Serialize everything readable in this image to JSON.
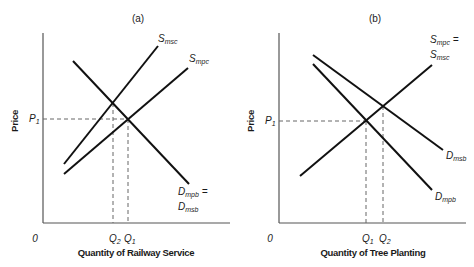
{
  "panels": [
    {
      "title": "(a)",
      "ylabel": "Price",
      "xlabel": "Quantity of Railway Service",
      "origin_label": "0",
      "price_label": {
        "main": "P",
        "sub": "1"
      },
      "quantity_labels": [
        {
          "main": "Q",
          "sub": "2"
        },
        {
          "main": "Q",
          "sub": "1"
        }
      ],
      "curves": [
        {
          "name": "S_msc",
          "label_main": "S",
          "label_sub": "msc"
        },
        {
          "name": "S_mpc",
          "label_main": "S",
          "label_sub": "mpc"
        },
        {
          "name": "D_mpb = D_msb",
          "label_line1_main": "D",
          "label_line1_sub": "mpb",
          "label_line1_suffix": " =",
          "label_line2_main": "D",
          "label_line2_sub": "msb"
        }
      ]
    },
    {
      "title": "(b)",
      "ylabel": "Price",
      "xlabel": "Quantity of Tree Planting",
      "origin_label": "0",
      "price_label": {
        "main": "P",
        "sub": "1"
      },
      "quantity_labels": [
        {
          "main": "Q",
          "sub": "1"
        },
        {
          "main": "Q",
          "sub": "2"
        }
      ],
      "curves": [
        {
          "name": "S_mpc = S_msc",
          "label_line1_main": "S",
          "label_line1_sub": "mpc",
          "label_line1_suffix": " =",
          "label_line2_main": "S",
          "label_line2_sub": "msc"
        },
        {
          "name": "D_msb",
          "label_main": "D",
          "label_sub": "msb"
        },
        {
          "name": "D_mpb",
          "label_main": "D",
          "label_sub": "mpb"
        }
      ]
    }
  ]
}
